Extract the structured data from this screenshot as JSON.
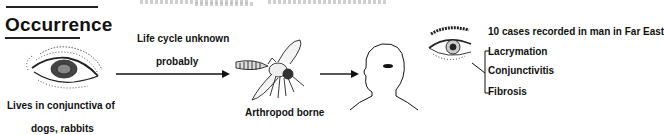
{
  "section": {
    "title": "Occurrence"
  },
  "reservoir": {
    "icon": "animal-eye-icon",
    "caption_line1": "Lives in conjunctiva of",
    "caption_line2": "dogs, rabbits"
  },
  "transmission": {
    "label_line1": "Life cycle unknown",
    "label_line2": "probably",
    "vector_icon": "fly-icon",
    "vector_label": "Arthropod borne"
  },
  "host": {
    "icon": "human-head-icon"
  },
  "human_disease": {
    "icon": "human-eye-icon",
    "cases": "10 cases recorded in man in Far East",
    "symptoms": [
      "Lacrymation",
      "Conjunctivitis",
      "Fibrosis"
    ]
  },
  "colors": {
    "ink": "#111111",
    "background": "#ffffff"
  }
}
